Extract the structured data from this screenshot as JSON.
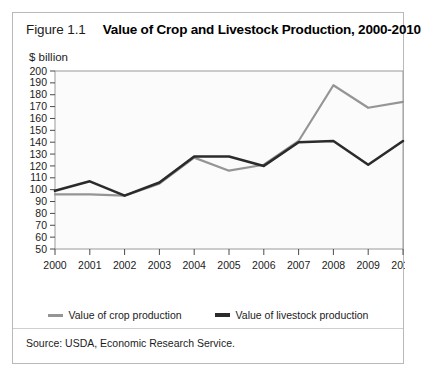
{
  "figure": {
    "number": "Figure 1.1",
    "title": "Value of Crop and Livestock Production, 2000-2010",
    "axis_unit": "$ billion",
    "source": "Source: USDA, Economic Research Service."
  },
  "legend": {
    "items": [
      {
        "label": "Value of crop production",
        "color": "#959595",
        "key": "crop"
      },
      {
        "label": "Value of livestock production",
        "color": "#2b2b2b",
        "key": "livestock"
      }
    ]
  },
  "chart_data": {
    "type": "line",
    "title": "Value of Crop and Livestock Production, 2000-2010",
    "xlabel": "",
    "ylabel": "$ billion",
    "ylim": [
      50,
      200
    ],
    "ytick_step": 10,
    "yticks": [
      200,
      190,
      180,
      170,
      160,
      150,
      140,
      130,
      120,
      110,
      100,
      90,
      80,
      70,
      60,
      50
    ],
    "grid": false,
    "legend_position": "bottom-center",
    "categories": [
      2000,
      2001,
      2002,
      2003,
      2004,
      2005,
      2006,
      2007,
      2008,
      2009,
      2010
    ],
    "x": [
      "2000",
      "2001",
      "2002",
      "2003",
      "2004",
      "2005",
      "2006",
      "2007",
      "2008",
      "2009",
      "2010"
    ],
    "series": [
      {
        "name": "Value of crop production",
        "color": "#959595",
        "values": [
          96,
          96,
          95,
          105,
          127,
          116,
          121,
          141,
          188,
          169,
          174
        ]
      },
      {
        "name": "Value of livestock production",
        "color": "#2b2b2b",
        "values": [
          99,
          107,
          95,
          106,
          128,
          128,
          120,
          140,
          141,
          121,
          141
        ]
      }
    ]
  }
}
